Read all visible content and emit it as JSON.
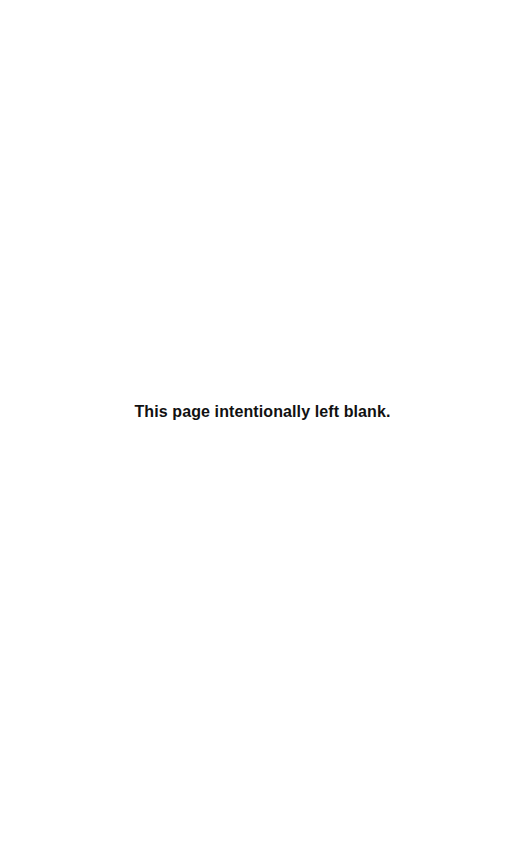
{
  "page": {
    "notice": "This page intentionally left blank."
  }
}
